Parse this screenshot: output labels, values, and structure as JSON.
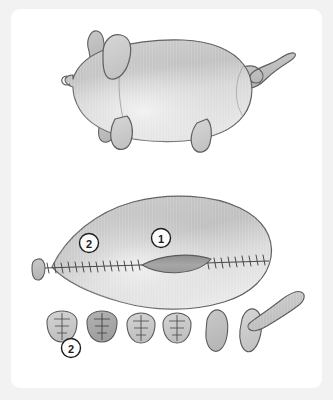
{
  "page": {
    "background_color": "#f2f2f2",
    "card_color": "#ffffff",
    "title": "Stuffed pig sewing pattern diagram"
  },
  "palette": {
    "outline": "#5a5a5a",
    "body_fill_light": "#d8d8d8",
    "body_fill_mid": "#c4c4c4",
    "body_fill_dark": "#a9a9a9",
    "opening_fill": "#9a9a9a",
    "stitch_color": "#4a4a4a",
    "callout_text": "#1d1d1d"
  },
  "figures": [
    {
      "id": "finished-toy",
      "name": "finished-pig-toy",
      "label": "Finished stuffed pig",
      "parts": [
        "body",
        "head",
        "snout",
        "ear-front",
        "ear-back",
        "foreleg",
        "hindleg",
        "curly-tail"
      ]
    },
    {
      "id": "pattern-layout",
      "name": "pattern-pieces-layout",
      "label": "Cut pattern pieces",
      "parts": [
        "body-panel",
        "snout-oval",
        "leg-piece-1",
        "leg-piece-2",
        "leg-piece-3",
        "leg-piece-4",
        "ear-piece-1",
        "ear-piece-2",
        "tail-strip"
      ]
    }
  ],
  "callouts": [
    {
      "id": "callout-1",
      "text": "1",
      "target": "body-panel-right",
      "x": 161,
      "y": 238
    },
    {
      "id": "callout-2-body",
      "text": "2",
      "target": "body-panel-left",
      "x": 88,
      "y": 242
    },
    {
      "id": "callout-2-legs",
      "text": "2",
      "target": "leg-pieces-group",
      "x": 71,
      "y": 347
    }
  ],
  "seams": {
    "body_seam_label": "stitched seam",
    "opening_label": "turning opening",
    "leg_seam_label": "leg dart stitches"
  }
}
